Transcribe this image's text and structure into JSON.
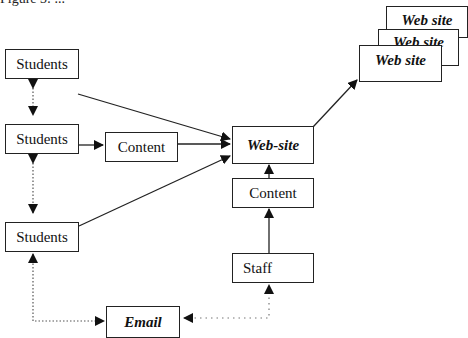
{
  "figure": {
    "caption": "Figure 3: ..."
  },
  "nodes": {
    "students_top": "Students",
    "students_mid": "Students",
    "students_bottom": "Students",
    "content_left": "Content",
    "website_center": "Web-site",
    "content_center": "Content",
    "staff": "Staff",
    "email": "Email",
    "web_site_stack": [
      "Web site",
      "Web site",
      "Web site"
    ]
  },
  "edges": [
    {
      "from": "students_top",
      "to": "students_mid",
      "style": "dotted",
      "bidirectional": true
    },
    {
      "from": "students_mid",
      "to": "students_bottom",
      "style": "dotted",
      "bidirectional": true
    },
    {
      "from": "students_top",
      "to": "website_center",
      "style": "solid"
    },
    {
      "from": "students_mid",
      "to": "content_left",
      "style": "solid"
    },
    {
      "from": "content_left",
      "to": "website_center",
      "style": "solid"
    },
    {
      "from": "students_bottom",
      "to": "website_center",
      "style": "solid"
    },
    {
      "from": "content_center",
      "to": "website_center",
      "style": "solid"
    },
    {
      "from": "staff",
      "to": "content_center",
      "style": "solid"
    },
    {
      "from": "website_center",
      "to": "web_site_stack",
      "style": "solid"
    },
    {
      "from": "email",
      "to": "students_bottom",
      "style": "dotted",
      "bidirectional": true
    },
    {
      "from": "staff",
      "to": "email",
      "style": "dotted",
      "bidirectional": true
    }
  ]
}
